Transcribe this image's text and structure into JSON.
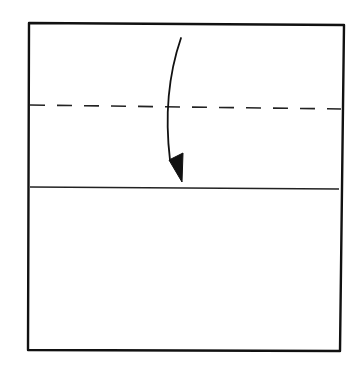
{
  "diagram": {
    "type": "origami-fold-step",
    "colors": {
      "background": "#ffffff",
      "line": "#111111"
    },
    "paper": {
      "shape": "square"
    },
    "fold_line": {
      "style": "dashed",
      "meaning": "valley-fold"
    },
    "reference_line": {
      "style": "solid"
    },
    "arrow": {
      "direction": "down",
      "meaning": "fold top edge down to line"
    }
  }
}
